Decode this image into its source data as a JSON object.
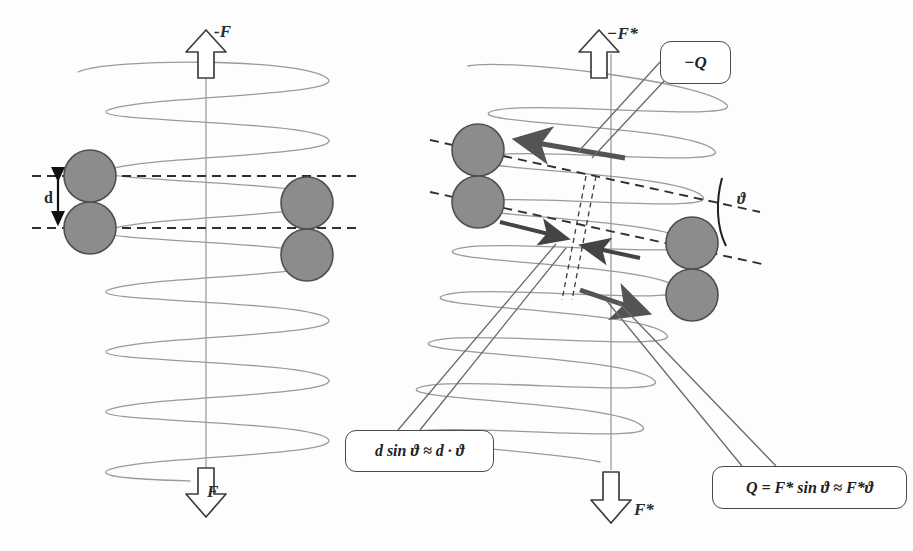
{
  "figure": {
    "background_color": "#fdfdfd",
    "helix_color": "#8a8a8a",
    "sphere_fill": "#8c8c8c",
    "sphere_stroke": "#4d4d4d",
    "dashed_color": "#3a3a3a",
    "arrow_outline_color": "#3d3d3d",
    "force_arrow_color": "#595959",
    "callout_border_color": "#4a4a4a"
  },
  "left_panel": {
    "name": "undeformed-helix",
    "top_force_label": "-F",
    "bottom_force_label": "F",
    "spacing_label": "d",
    "helix_turns": 8,
    "sphere_pairs": 2,
    "dashed_guide_lines": 2
  },
  "right_panel": {
    "name": "sheared-helix",
    "top_force_label": "−F*",
    "bottom_force_label": "F*",
    "torque_label": "−Q",
    "angle_label": "ϑ",
    "helix_turns": 8,
    "sphere_pairs": 2,
    "dashed_guide_lines": 2,
    "tilt_degrees": 12
  },
  "callouts": [
    {
      "name": "torque-callout",
      "text": "−Q"
    },
    {
      "name": "displacement-callout",
      "text": "d sin ϑ ≈ d · ϑ"
    },
    {
      "name": "torque-formula-callout",
      "text": "Q = F* sin ϑ ≈ F*ϑ"
    }
  ],
  "annotations": {
    "axis_label_top_left": "-F",
    "axis_label_bottom_left": "F",
    "axis_label_top_right": "−F*",
    "axis_label_bottom_right": "F*",
    "distance": "d",
    "angle": "ϑ",
    "torque": "−Q",
    "relation_displacement": "d sin ϑ ≈ d · ϑ",
    "relation_torque": "Q = F* sin ϑ ≈ F*ϑ"
  }
}
